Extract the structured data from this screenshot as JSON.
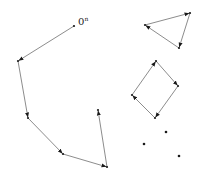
{
  "diagram": {
    "width": 203,
    "height": 182,
    "colors": {
      "edge": "#6e6e6e",
      "vertex": "#1a1a1a",
      "background": "#ffffff"
    },
    "label": {
      "base": "0",
      "superscript": "n",
      "x": 78,
      "y": 25
    },
    "components": [
      {
        "name": "open-path",
        "type": "path",
        "closed": false,
        "points": [
          [
            74,
            26
          ],
          [
            18,
            61
          ],
          [
            28,
            118
          ],
          [
            63,
            154
          ],
          [
            107,
            167
          ],
          [
            98,
            110
          ]
        ]
      },
      {
        "name": "triangle",
        "type": "cycle",
        "closed": true,
        "points": [
          [
            145,
            25
          ],
          [
            190,
            13
          ],
          [
            179,
            48
          ]
        ]
      },
      {
        "name": "quadrilateral",
        "type": "cycle",
        "closed": true,
        "points": [
          [
            156,
            61
          ],
          [
            178,
            86
          ],
          [
            155,
            118
          ],
          [
            132,
            95
          ]
        ]
      },
      {
        "name": "isolated-points",
        "type": "points",
        "points": [
          [
            166,
            132
          ],
          [
            144,
            144
          ],
          [
            179,
            156
          ]
        ]
      }
    ]
  }
}
